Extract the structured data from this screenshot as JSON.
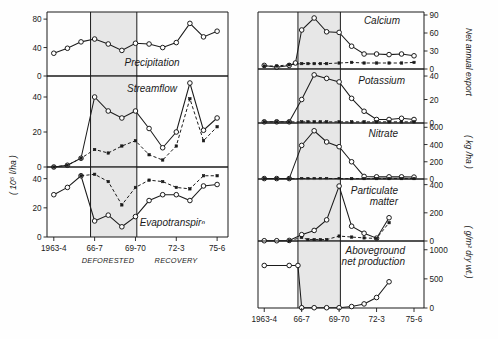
{
  "figure": {
    "left_axis_title": "( 10⁵ l/ha )",
    "right_axis_title_1": "Net  annual  export",
    "right_axis_title_2": "( kg /ha )",
    "right_axis_title_3": "( g/m² dry wt.)",
    "period_labels": [
      "DEFORESTED",
      "RECOVERY"
    ],
    "x_tick_labels": [
      "1963-4",
      "66-7",
      "69-70",
      "72-3",
      "75-6"
    ],
    "x_tick_values": [
      1963.5,
      1966.5,
      1969.5,
      1972.5,
      1975.5
    ]
  },
  "chart_data": [
    {
      "type": "line",
      "title": "Precipitation",
      "panel": "left",
      "ylabel": "( 10⁵ l/ha )",
      "ylim": [
        0,
        90
      ],
      "yticks": [
        0,
        40,
        80
      ],
      "xlim": [
        1963,
        1976.3
      ],
      "xlabel": "",
      "grid": false,
      "shaded_region": [
        1966.2,
        1969.6
      ],
      "series": [
        {
          "name": "Precipitation",
          "style": "solid-open",
          "x": [
            1963.5,
            1964.5,
            1965.5,
            1966.5,
            1967.5,
            1968.5,
            1969.5,
            1970.5,
            1971.5,
            1972.5,
            1973.5,
            1974.5,
            1975.5
          ],
          "values": [
            32,
            39,
            48,
            52,
            45,
            36,
            46,
            45,
            40,
            47,
            74,
            55,
            63
          ]
        }
      ]
    },
    {
      "type": "line",
      "title": "Streamflow",
      "panel": "left",
      "ylabel": "( 10⁵ l/ha )",
      "ylim": [
        0,
        52
      ],
      "yticks": [
        0,
        20,
        40
      ],
      "xlim": [
        1963,
        1976.3
      ],
      "grid": false,
      "shaded_region": [
        1966.2,
        1969.6
      ],
      "series": [
        {
          "name": "Deforested watershed",
          "style": "solid-open",
          "x": [
            1963.5,
            1964.5,
            1965.5,
            1966.5,
            1967.5,
            1968.5,
            1969.5,
            1970.5,
            1971.5,
            1972.5,
            1973.5,
            1974.5,
            1975.5
          ],
          "values": [
            0,
            1,
            5,
            40,
            32,
            28,
            32,
            22,
            11,
            20,
            48,
            21,
            28
          ]
        },
        {
          "name": "Reference watershed",
          "style": "dashed-closed",
          "x": [
            1963.5,
            1964.5,
            1965.5,
            1966.5,
            1967.5,
            1968.5,
            1969.5,
            1970.5,
            1971.5,
            1972.5,
            1973.5,
            1974.5,
            1975.5
          ],
          "values": [
            0,
            1,
            5,
            10,
            8,
            12,
            15,
            7,
            4,
            12,
            39,
            15,
            23
          ]
        }
      ]
    },
    {
      "type": "line",
      "title": "Evapotranspirⁿ",
      "panel": "left",
      "ylabel": "( 10⁵ l/ha )",
      "ylim": [
        0,
        48
      ],
      "yticks": [
        0,
        20,
        40
      ],
      "xlim": [
        1963,
        1976.3
      ],
      "grid": false,
      "shaded_region": [
        1966.2,
        1969.6
      ],
      "series": [
        {
          "name": "Deforested watershed",
          "style": "solid-open",
          "x": [
            1963.5,
            1964.5,
            1965.5,
            1966.5,
            1967.5,
            1968.5,
            1969.5,
            1970.5,
            1971.5,
            1972.5,
            1973.5,
            1974.5,
            1975.5
          ],
          "values": [
            29,
            34,
            42,
            11,
            15,
            7,
            14,
            25,
            29,
            29,
            25,
            35,
            36
          ]
        },
        {
          "name": "Reference watershed",
          "style": "dashed-closed",
          "x": [
            1965.5,
            1966.5,
            1967.5,
            1968.5,
            1969.5,
            1970.5,
            1971.5,
            1972.5,
            1973.5,
            1974.5,
            1975.5
          ],
          "values": [
            42,
            43,
            38,
            22,
            34,
            39,
            38,
            34,
            33,
            42,
            42
          ]
        }
      ]
    },
    {
      "type": "line",
      "title": "Calcium",
      "panel": "right",
      "ylabel": "( kg /ha )",
      "ylim": [
        0,
        95
      ],
      "yticks": [
        0,
        30,
        60,
        90
      ],
      "xlim": [
        1963,
        1976.3
      ],
      "grid": false,
      "shaded_region": [
        1966.2,
        1969.6
      ],
      "series": [
        {
          "name": "Deforested watershed",
          "style": "solid-open",
          "x": [
            1963.5,
            1964.5,
            1965.5,
            1966.0,
            1966.5,
            1967.5,
            1968.5,
            1969.5,
            1970.5,
            1971.5,
            1972.5,
            1973.5,
            1974.5,
            1975.5
          ],
          "values": [
            6,
            3,
            6,
            10,
            65,
            85,
            62,
            61,
            38,
            25,
            25,
            24,
            25,
            22
          ]
        },
        {
          "name": "Reference watershed",
          "style": "dashed-closed",
          "x": [
            1963.5,
            1964.5,
            1965.5,
            1966.5,
            1967.0,
            1967.5,
            1968.0,
            1968.5,
            1969.5,
            1970.5,
            1971.5,
            1972.5,
            1973.5,
            1974.5,
            1975.5
          ],
          "values": [
            5,
            5,
            7,
            9,
            9,
            9,
            9,
            9,
            10,
            11,
            10,
            10,
            10,
            10,
            11
          ]
        }
      ]
    },
    {
      "type": "line",
      "title": "Potassium",
      "panel": "right",
      "ylabel": "( kg /ha )",
      "ylim": [
        0,
        46
      ],
      "yticks": [
        0,
        20,
        40
      ],
      "xlim": [
        1963,
        1976.3
      ],
      "grid": false,
      "shaded_region": [
        1966.2,
        1969.6
      ],
      "series": [
        {
          "name": "Deforested watershed",
          "style": "solid-open",
          "x": [
            1963.5,
            1964.5,
            1965.5,
            1966.5,
            1967.5,
            1968.5,
            1969.5,
            1970.5,
            1971.5,
            1972.5,
            1973.5,
            1974.5,
            1975.5
          ],
          "values": [
            1,
            1,
            1,
            20,
            41,
            38,
            35,
            21,
            10,
            3,
            3,
            4,
            3
          ]
        },
        {
          "name": "Reference watershed",
          "style": "dashed-closed",
          "x": [
            1963.5,
            1964.5,
            1965.5,
            1966.5,
            1967.0,
            1967.5,
            1968.0,
            1968.5,
            1969.5,
            1970.5,
            1971.5,
            1972.5,
            1973.5,
            1974.5,
            1975.5
          ],
          "values": [
            1,
            1,
            1,
            1,
            1,
            1,
            1,
            1,
            1,
            1,
            1,
            1,
            1,
            1,
            1
          ]
        }
      ]
    },
    {
      "type": "line",
      "title": "Nitrate",
      "panel": "right",
      "ylabel": "( kg /ha )",
      "ylim": [
        0,
        650
      ],
      "yticks": [
        0,
        200,
        400,
        600
      ],
      "xlim": [
        1963,
        1976.3
      ],
      "grid": false,
      "shaded_region": [
        1966.2,
        1969.6
      ],
      "series": [
        {
          "name": "Deforested watershed",
          "style": "solid-open",
          "x": [
            1963.5,
            1964.5,
            1965.5,
            1966.5,
            1967.5,
            1968.5,
            1969.5,
            1970.5,
            1971.5,
            1972.5,
            1973.5,
            1974.5,
            1975.5
          ],
          "values": [
            5,
            5,
            5,
            390,
            560,
            430,
            375,
            200,
            30,
            25,
            25,
            25,
            22
          ]
        },
        {
          "name": "Reference watershed",
          "style": "dashed-closed",
          "x": [
            1963.5,
            1964.5,
            1965.5,
            1966.5,
            1967.0,
            1967.5,
            1968.0,
            1968.5,
            1969.5,
            1970.5,
            1971.5,
            1972.5,
            1973.5,
            1974.5,
            1975.5
          ],
          "values": [
            5,
            5,
            5,
            5,
            5,
            5,
            5,
            5,
            5,
            5,
            5,
            5,
            5,
            5,
            5
          ]
        }
      ]
    },
    {
      "type": "line",
      "title": "Particulate matter",
      "panel": "right",
      "ylabel": "( kg /ha )",
      "ylim": [
        0,
        440
      ],
      "yticks": [
        0,
        200,
        400
      ],
      "xlim": [
        1963,
        1976.3
      ],
      "grid": false,
      "shaded_region": [
        1966.2,
        1969.6
      ],
      "series": [
        {
          "name": "Deforested watershed",
          "style": "solid-open",
          "x": [
            1963.5,
            1964.5,
            1965.5,
            1966.5,
            1967.5,
            1968.5,
            1969.5,
            1970.5,
            1971.5,
            1972.5,
            1973.5
          ],
          "values": [
            2,
            2,
            4,
            45,
            75,
            150,
            390,
            105,
            55,
            20,
            165
          ]
        },
        {
          "name": "Reference watershed",
          "style": "dashed-closed",
          "x": [
            1965.5,
            1966.5,
            1967.0,
            1967.5,
            1968.0,
            1968.5,
            1969.5,
            1970.5,
            1971.5,
            1972.5,
            1973.5
          ],
          "values": [
            2,
            25,
            10,
            10,
            10,
            10,
            35,
            28,
            22,
            18,
            130
          ]
        }
      ]
    },
    {
      "type": "line",
      "title": "Aboveground net production",
      "panel": "right",
      "ylabel": "( g/m² dry wt.)",
      "ylim": [
        0,
        1150
      ],
      "yticks": [
        0,
        500,
        1000
      ],
      "xlim": [
        1963,
        1976.3
      ],
      "grid": false,
      "shaded_region": [
        1966.2,
        1969.6
      ],
      "series": [
        {
          "name": "Deforested watershed",
          "style": "solid-open",
          "x": [
            1963.5,
            1965.5,
            1966.2,
            1966.5,
            1967.5,
            1968.5,
            1969.5,
            1970.5,
            1971.5,
            1972.5,
            1973.5
          ],
          "values": [
            730,
            730,
            730,
            5,
            5,
            5,
            5,
            25,
            70,
            180,
            450
          ]
        }
      ]
    }
  ]
}
